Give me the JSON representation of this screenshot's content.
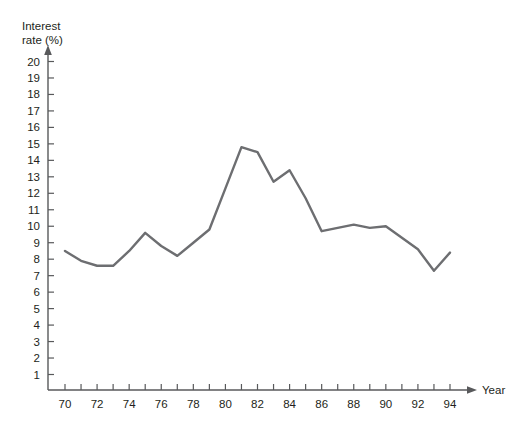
{
  "chart_data": {
    "type": "line",
    "title": "",
    "subtitle": "",
    "xlabel": "Year",
    "ylabel": "Interest rate (%)",
    "ylabel_line1": "Interest",
    "ylabel_line2": "rate (%)",
    "xlim": [
      69.2,
      95.0
    ],
    "ylim": [
      0,
      20.6
    ],
    "grid": false,
    "legend": null,
    "y_ticks": [
      1,
      2,
      3,
      4,
      5,
      6,
      7,
      8,
      9,
      10,
      11,
      12,
      13,
      14,
      15,
      16,
      17,
      18,
      19,
      20
    ],
    "y_tick_labels": [
      "1",
      "2",
      "3",
      "4",
      "5",
      "6",
      "7",
      "8",
      "9",
      "10",
      "11",
      "12",
      "13",
      "14",
      "15",
      "16",
      "17",
      "18",
      "19",
      "20"
    ],
    "x_ticks": [
      70,
      71,
      72,
      73,
      74,
      75,
      76,
      77,
      78,
      79,
      80,
      81,
      82,
      83,
      84,
      85,
      86,
      87,
      88,
      89,
      90,
      91,
      92,
      93,
      94
    ],
    "x_tick_labels_shown": [
      70,
      72,
      74,
      76,
      78,
      80,
      82,
      84,
      86,
      88,
      90,
      92,
      94
    ],
    "x_tick_label_strings": [
      "70",
      "72",
      "74",
      "76",
      "78",
      "80",
      "82",
      "84",
      "86",
      "88",
      "90",
      "92",
      "94"
    ],
    "line_color": "#6d6e71",
    "axis_color": "#58595b",
    "text_color": "#231f20",
    "x": [
      70,
      71,
      72,
      73,
      74,
      75,
      76,
      77,
      78,
      79,
      80,
      81,
      82,
      83,
      84,
      85,
      86,
      87,
      88,
      89,
      90,
      91,
      92,
      93,
      94
    ],
    "values": [
      8.5,
      7.9,
      7.6,
      7.6,
      8.5,
      9.6,
      8.8,
      8.2,
      9.0,
      9.8,
      12.3,
      14.8,
      14.5,
      12.7,
      13.4,
      11.7,
      9.7,
      9.9,
      10.1,
      9.9,
      10.0,
      9.3,
      8.6,
      7.3,
      8.4
    ],
    "series": [
      {
        "name": "Interest rate",
        "values": [
          8.5,
          7.9,
          7.6,
          7.6,
          8.5,
          9.6,
          8.8,
          8.2,
          9.0,
          9.8,
          12.3,
          14.8,
          14.5,
          12.7,
          13.4,
          11.7,
          9.7,
          9.9,
          10.1,
          9.9,
          10.0,
          9.3,
          8.6,
          7.3,
          8.4
        ]
      }
    ],
    "annotations": []
  }
}
